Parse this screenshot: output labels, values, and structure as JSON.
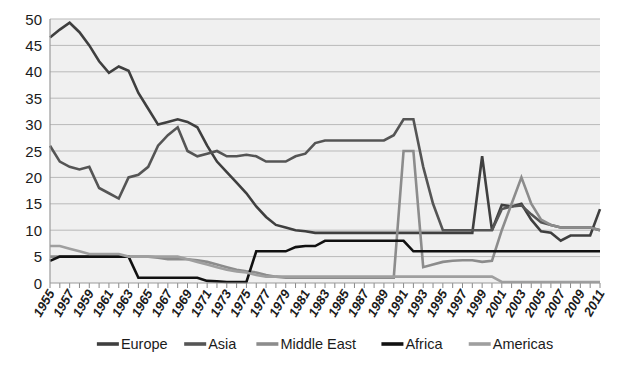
{
  "chart_data": {
    "type": "line",
    "title": "",
    "xlabel": "",
    "ylabel": "",
    "ylim": [
      0,
      50
    ],
    "ytick_step": 5,
    "grid": true,
    "legend_position": "bottom",
    "x": [
      1955,
      1956,
      1957,
      1958,
      1959,
      1960,
      1961,
      1962,
      1963,
      1964,
      1965,
      1966,
      1967,
      1968,
      1969,
      1970,
      1971,
      1972,
      1973,
      1974,
      1975,
      1976,
      1977,
      1978,
      1979,
      1980,
      1981,
      1982,
      1983,
      1984,
      1985,
      1986,
      1987,
      1988,
      1989,
      1990,
      1991,
      1992,
      1993,
      1994,
      1995,
      1996,
      1997,
      1998,
      1999,
      2000,
      2001,
      2002,
      2003,
      2004,
      2005,
      2006,
      2007,
      2008,
      2009,
      2010,
      2011
    ],
    "xticks": [
      "1955",
      "1957",
      "1959",
      "1961",
      "1963",
      "1965",
      "1967",
      "1969",
      "1971",
      "1973",
      "1975",
      "1977",
      "1979",
      "1981",
      "1983",
      "1985",
      "1987",
      "1989",
      "1991",
      "1993",
      "1995",
      "1997",
      "1999",
      "2001",
      "2003",
      "2005",
      "2007",
      "2009",
      "2011"
    ],
    "yticks": [
      "0",
      "5",
      "10",
      "15",
      "20",
      "25",
      "30",
      "35",
      "40",
      "45",
      "50"
    ],
    "series": [
      {
        "name": "Europe",
        "color": "#3f3f3f",
        "width": 2.6,
        "values": [
          46.5,
          48,
          49.3,
          47.5,
          45,
          42,
          39.8,
          41,
          40.2,
          36,
          33,
          30,
          30.5,
          31,
          30.5,
          29.5,
          26,
          23,
          21,
          19,
          17,
          14.5,
          12.5,
          11,
          10.5,
          10,
          9.8,
          9.5,
          9.5,
          9.5,
          9.5,
          9.5,
          9.5,
          9.5,
          9.5,
          9.5,
          9.5,
          9.5,
          9.5,
          9.5,
          9.5,
          9.5,
          9.5,
          9.5,
          24,
          10,
          14.8,
          14.5,
          15,
          12,
          9.8,
          9.5,
          8,
          9,
          9,
          9,
          14
        ]
      },
      {
        "name": "Asia",
        "color": "#555555",
        "width": 2.6,
        "values": [
          26,
          23,
          22,
          21.5,
          22,
          18,
          17,
          16,
          20,
          20.5,
          22,
          26,
          28,
          29.5,
          25,
          24,
          24.5,
          25,
          24,
          24,
          24.3,
          24,
          23,
          23,
          23,
          24,
          24.5,
          26.5,
          27,
          27,
          27,
          27,
          27,
          27,
          27,
          28,
          31,
          31,
          22,
          15,
          10,
          10,
          10,
          10,
          10,
          10,
          14,
          14.5,
          14.7,
          13,
          11.5,
          11,
          10.5,
          10.5,
          10.5,
          10.5,
          10
        ]
      },
      {
        "name": "Middle East",
        "color": "#8c8c8c",
        "width": 2.6,
        "values": [
          5,
          5,
          5,
          5,
          5,
          5.3,
          5,
          5,
          5,
          5,
          5,
          4.8,
          4.5,
          4.5,
          4.5,
          4.3,
          4,
          3.5,
          3,
          2.5,
          2.2,
          2,
          1.5,
          1.2,
          1,
          1,
          1,
          1,
          1,
          1,
          1,
          1,
          1,
          1,
          1,
          1,
          25,
          25,
          3,
          3.5,
          4,
          4.2,
          4.3,
          4.3,
          4,
          4.2,
          10,
          15,
          20,
          15,
          12,
          11,
          10.5,
          10.5,
          10.5,
          10.5,
          10
        ]
      },
      {
        "name": "Africa",
        "color": "#111111",
        "width": 2.6,
        "values": [
          4.2,
          5,
          5,
          5,
          5,
          5,
          5,
          5,
          5,
          1,
          1,
          1,
          1,
          1,
          1,
          1,
          0.4,
          0.3,
          0.2,
          0.2,
          0.2,
          6,
          6,
          6,
          6,
          6.8,
          7,
          7,
          8,
          8,
          8,
          8,
          8,
          8,
          8,
          8,
          8,
          6,
          6,
          6,
          6,
          6,
          6,
          6,
          6,
          6,
          6,
          6,
          6,
          6,
          6,
          6,
          6,
          6,
          6,
          6,
          6
        ]
      },
      {
        "name": "Americas",
        "color": "#9f9f9f",
        "width": 2.6,
        "values": [
          7,
          7,
          6.5,
          6,
          5.5,
          5.5,
          5.5,
          5.5,
          5,
          5,
          5,
          5,
          5,
          5,
          4.5,
          4,
          3.5,
          3,
          2.5,
          2.2,
          2,
          1.5,
          1.2,
          1.2,
          1.2,
          1.2,
          1.2,
          1.2,
          1.2,
          1.2,
          1.2,
          1.2,
          1.2,
          1.2,
          1.2,
          1.2,
          1.2,
          1.2,
          1.2,
          1.2,
          1.2,
          1.2,
          1.2,
          1.2,
          1.2,
          1.2,
          0.2,
          0.2,
          0.2,
          0.2,
          0.2,
          0.2,
          0.2,
          0.2,
          0.2,
          0.2,
          0.2
        ]
      }
    ]
  },
  "legend": {
    "items": [
      {
        "label": "Europe",
        "color": "#3f3f3f"
      },
      {
        "label": "Asia",
        "color": "#555555"
      },
      {
        "label": "Middle East",
        "color": "#8c8c8c"
      },
      {
        "label": "Africa",
        "color": "#111111"
      },
      {
        "label": "Americas",
        "color": "#9f9f9f"
      }
    ]
  }
}
